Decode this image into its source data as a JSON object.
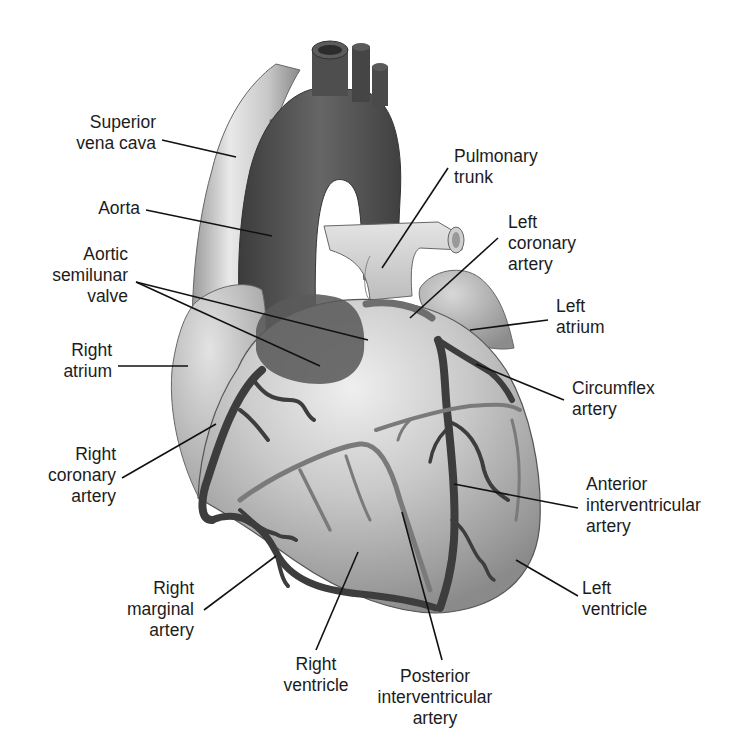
{
  "diagram": {
    "colors": {
      "background": "#ffffff",
      "text": "#1c1c1c",
      "leader_line": "#111111",
      "vena_cava_light": "#e8e8e8",
      "vena_cava_mid": "#b9b9b9",
      "aorta_dark": "#4a4a4a",
      "aorta_mid": "#606060",
      "pulmonary_light": "#d9d9d9",
      "heart_light": "#e6e6e6",
      "heart_mid": "#bcbcbc",
      "heart_dark": "#8f8f8f",
      "artery": "#3f3f3f",
      "vein": "#7c7c7c"
    }
  },
  "labels": [
    {
      "id": "superior-vena-cava",
      "text": "Superior\nvena cava",
      "x": 60,
      "y": 112,
      "align": "right",
      "w": 96,
      "line": [
        162,
        140,
        236,
        157
      ]
    },
    {
      "id": "aorta",
      "text": "Aorta",
      "x": 88,
      "y": 198,
      "align": "right",
      "w": 52,
      "line": [
        146,
        210,
        272,
        236
      ]
    },
    {
      "id": "aortic-semilunar-valve",
      "text": "Aortic\nsemilunar\nvalve",
      "x": 30,
      "y": 244,
      "align": "right",
      "w": 98,
      "line": [
        136,
        282,
        368,
        340
      ],
      "line2": [
        136,
        282,
        320,
        366
      ]
    },
    {
      "id": "right-atrium",
      "text": "Right\natrium",
      "x": 40,
      "y": 340,
      "align": "right",
      "w": 72,
      "line": [
        118,
        366,
        188,
        366
      ]
    },
    {
      "id": "right-coronary-artery",
      "text": "Right\ncoronary\nartery",
      "x": 26,
      "y": 444,
      "align": "right",
      "w": 90,
      "line": [
        122,
        478,
        216,
        424
      ]
    },
    {
      "id": "right-marginal-artery",
      "text": "Right\nmarginal\nartery",
      "x": 108,
      "y": 578,
      "align": "right",
      "w": 86,
      "line": [
        204,
        610,
        276,
        556
      ]
    },
    {
      "id": "right-ventricle",
      "text": "Right\nventricle",
      "x": 280,
      "y": 654,
      "align": "center",
      "w": 72,
      "line": [
        316,
        650,
        358,
        552
      ]
    },
    {
      "id": "posterior-interventricular-artery",
      "text": "Posterior\ninterventricular\nartery",
      "x": 372,
      "y": 666,
      "align": "center",
      "w": 126,
      "line": [
        442,
        660,
        402,
        512
      ]
    },
    {
      "id": "left-ventricle",
      "text": "Left\nventricle",
      "x": 582,
      "y": 578,
      "align": "left",
      "w": 80,
      "line": [
        578,
        596,
        516,
        560
      ]
    },
    {
      "id": "anterior-interventricular-artery",
      "text": "Anterior\ninterventricular\nartery",
      "x": 586,
      "y": 474,
      "align": "left",
      "w": 140,
      "line": [
        578,
        508,
        454,
        484
      ]
    },
    {
      "id": "circumflex-artery",
      "text": "Circumflex\nartery",
      "x": 572,
      "y": 378,
      "align": "left",
      "w": 100,
      "line": [
        564,
        400,
        476,
        364
      ]
    },
    {
      "id": "left-atrium",
      "text": "Left\natrium",
      "x": 556,
      "y": 296,
      "align": "left",
      "w": 70,
      "line": [
        548,
        320,
        470,
        330
      ]
    },
    {
      "id": "left-coronary-artery",
      "text": "Left\ncoronary\nartery",
      "x": 508,
      "y": 212,
      "align": "left",
      "w": 86,
      "line": [
        498,
        238,
        410,
        318
      ]
    },
    {
      "id": "pulmonary-trunk",
      "text": "Pulmonary\ntrunk",
      "x": 454,
      "y": 146,
      "align": "left",
      "w": 100,
      "line": [
        448,
        168,
        382,
        268
      ]
    }
  ]
}
